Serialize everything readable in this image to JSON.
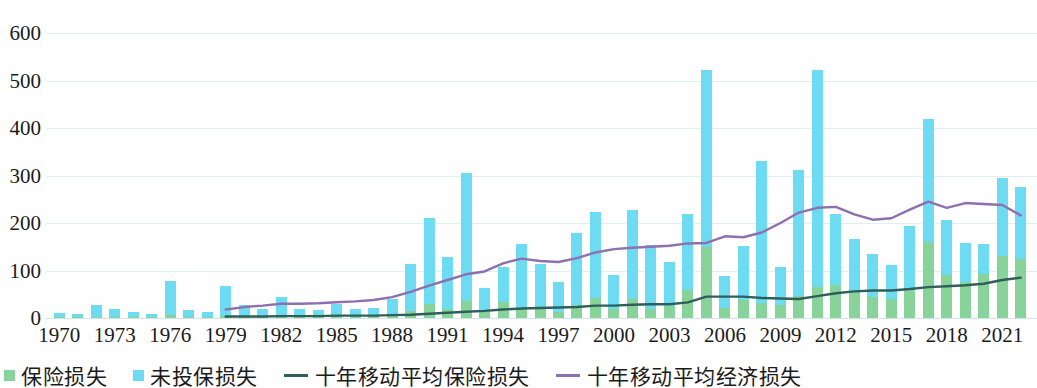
{
  "chart_data": {
    "type": "bar",
    "title": "",
    "subtitle": "",
    "xlabel": "",
    "ylabel": "",
    "ylim": [
      0,
      600
    ],
    "yticks": [
      0,
      100,
      200,
      300,
      400,
      500,
      600
    ],
    "grid": true,
    "legend_position": "bottom-left",
    "stacked": true,
    "x": [
      1970,
      1971,
      1972,
      1973,
      1974,
      1975,
      1976,
      1977,
      1978,
      1979,
      1980,
      1981,
      1982,
      1983,
      1984,
      1985,
      1986,
      1987,
      1988,
      1989,
      1990,
      1991,
      1992,
      1993,
      1994,
      1995,
      1996,
      1997,
      1998,
      1999,
      2000,
      2001,
      2002,
      2003,
      2004,
      2005,
      2006,
      2007,
      2008,
      2009,
      2010,
      2011,
      2012,
      2013,
      2014,
      2015,
      2016,
      2017,
      2018,
      2019,
      2020,
      2021,
      2022
    ],
    "xticks": [
      1970,
      1973,
      1976,
      1979,
      1982,
      1985,
      1988,
      1991,
      1994,
      1997,
      2000,
      2003,
      2006,
      2009,
      2012,
      2015,
      2018,
      2021
    ],
    "categories": [
      "1970",
      "1971",
      "1972",
      "1973",
      "1974",
      "1975",
      "1976",
      "1977",
      "1978",
      "1979",
      "1980",
      "1981",
      "1982",
      "1983",
      "1984",
      "1985",
      "1986",
      "1987",
      "1988",
      "1989",
      "1990",
      "1991",
      "1992",
      "1993",
      "1994",
      "1995",
      "1996",
      "1997",
      "1998",
      "1999",
      "2000",
      "2001",
      "2002",
      "2003",
      "2004",
      "2005",
      "2006",
      "2007",
      "2008",
      "2009",
      "2010",
      "2011",
      "2012",
      "2013",
      "2014",
      "2015",
      "2016",
      "2017",
      "2018",
      "2019",
      "2020",
      "2021",
      "2022"
    ],
    "series": [
      {
        "name": "保险损失",
        "color": "#87d39a",
        "values": [
          2,
          2,
          3,
          3,
          2,
          2,
          6,
          2,
          2,
          4,
          5,
          4,
          6,
          6,
          4,
          5,
          6,
          6,
          9,
          15,
          30,
          20,
          35,
          16,
          33,
          22,
          22,
          13,
          28,
          42,
          18,
          40,
          20,
          25,
          60,
          150,
          22,
          37,
          32,
          27,
          46,
          65,
          70,
          57,
          45,
          40,
          60,
          160,
          90,
          75,
          92,
          130,
          125
        ]
      },
      {
        "name": "未投保损失",
        "color": "#6ddcf2",
        "values": [
          8,
          7,
          25,
          15,
          11,
          7,
          72,
          14,
          10,
          64,
          22,
          15,
          38,
          14,
          13,
          24,
          13,
          16,
          31,
          99,
          180,
          108,
          270,
          48,
          75,
          133,
          92,
          63,
          150,
          181,
          72,
          187,
          133,
          93,
          158,
          372,
          66,
          114,
          298,
          81,
          265,
          458,
          148,
          110,
          90,
          72,
          133,
          258,
          116,
          82,
          64,
          165,
          150
        ]
      }
    ],
    "lines": [
      {
        "name": "十年移动平均保险损失",
        "color": "#2f5f5a",
        "x": [
          1979,
          1980,
          1981,
          1982,
          1983,
          1984,
          1985,
          1986,
          1987,
          1988,
          1989,
          1990,
          1991,
          1992,
          1993,
          1994,
          1995,
          1996,
          1997,
          1998,
          1999,
          2000,
          2001,
          2002,
          2003,
          2004,
          2005,
          2006,
          2007,
          2008,
          2009,
          2010,
          2011,
          2012,
          2013,
          2014,
          2015,
          2016,
          2017,
          2018,
          2019,
          2020,
          2021,
          2022
        ],
        "values": [
          3,
          3,
          3,
          4,
          4,
          4,
          5,
          5,
          5,
          6,
          7,
          9,
          11,
          13,
          15,
          18,
          20,
          21,
          22,
          23,
          26,
          26,
          28,
          29,
          29,
          33,
          45,
          45,
          45,
          42,
          41,
          40,
          46,
          52,
          56,
          58,
          58,
          61,
          65,
          67,
          69,
          72,
          80,
          85
        ]
      },
      {
        "name": "十年移动平均经济损失",
        "color": "#8e6fb0",
        "x": [
          1979,
          1980,
          1981,
          1982,
          1983,
          1984,
          1985,
          1986,
          1987,
          1988,
          1989,
          1990,
          1991,
          1992,
          1993,
          1994,
          1995,
          1996,
          1997,
          1998,
          1999,
          2000,
          2001,
          2002,
          2003,
          2004,
          2005,
          2006,
          2007,
          2008,
          2009,
          2010,
          2011,
          2012,
          2013,
          2014,
          2015,
          2016,
          2017,
          2018,
          2019,
          2020,
          2021,
          2022
        ],
        "values": [
          18,
          23,
          26,
          30,
          30,
          31,
          33,
          35,
          38,
          44,
          55,
          68,
          80,
          92,
          98,
          115,
          125,
          120,
          118,
          126,
          138,
          145,
          148,
          150,
          152,
          157,
          158,
          172,
          170,
          180,
          200,
          222,
          232,
          234,
          218,
          207,
          210,
          228,
          245,
          232,
          242,
          240,
          238,
          216
        ]
      }
    ],
    "legend": [
      {
        "label": "保险损失",
        "marker": "square",
        "color": "#87d39a"
      },
      {
        "label": "未投保损失",
        "marker": "square",
        "color": "#6ddcf2"
      },
      {
        "label": "十年移动平均保险损失",
        "marker": "line",
        "color": "#2f5f5a"
      },
      {
        "label": "十年移动平均经济损失",
        "marker": "line",
        "color": "#8e6fb0"
      }
    ]
  }
}
